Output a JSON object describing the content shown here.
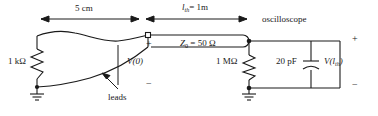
{
  "figure": {
    "type": "circuit-schematic",
    "background_color": "#ffffff",
    "line_color": "#1a1a1a",
    "text_color": "#1a1a1a"
  },
  "dimensions": {
    "lead_length": "5 cm",
    "line_length_symbol": "l",
    "line_length_subscript": "th",
    "line_length_equals": "= 1m"
  },
  "components": {
    "source_resistor": "1 kΩ",
    "scope_resistor": "1 MΩ",
    "scope_capacitor": "20 pF",
    "line_impedance_symbol": "Z",
    "line_impedance_subscript": "0",
    "line_impedance_value": "= 50 Ω"
  },
  "labels": {
    "oscilloscope": "oscilloscope",
    "leads": "leads",
    "voltage_input": "V(0)",
    "voltage_output_symbol": "V(l",
    "voltage_output_subscript": "th",
    "voltage_output_close": ")"
  },
  "polarity": {
    "input_plus": "+",
    "input_minus": "−",
    "output_plus": "+",
    "output_minus": "−"
  }
}
